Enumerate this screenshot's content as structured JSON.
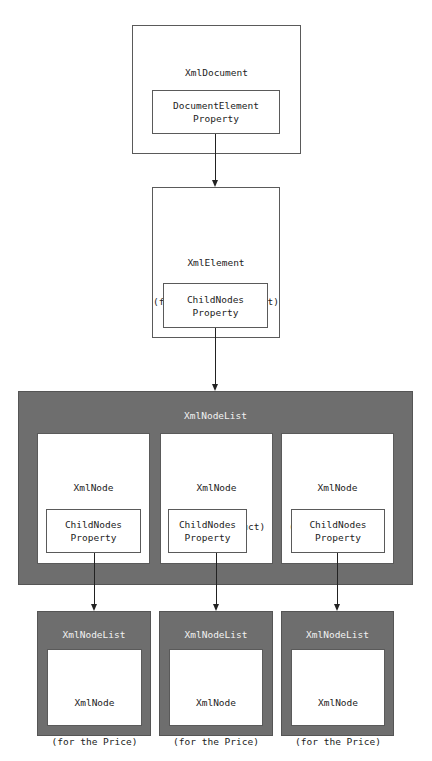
{
  "diagram": {
    "xml_document": {
      "title": "XmlDocument",
      "property_line1": "DocumentElement",
      "property_line2": "Property"
    },
    "xml_element": {
      "title_line1": "XmlElement",
      "title_line2": "(for the root element)",
      "property_line1": "ChildNodes",
      "property_line2": "Property"
    },
    "node_list": {
      "title": "XmlNodeList",
      "nodes": [
        {
          "title_line1": "XmlNode",
          "title_line2": "(for the Product)",
          "property_line1": "ChildNodes",
          "property_line2": "Property"
        },
        {
          "title_line1": "XmlNode",
          "title_line2": "(for the Product)",
          "property_line1": "ChildNodes",
          "property_line2": "Property"
        },
        {
          "title_line1": "XmlNode",
          "title_line2": "(for the Product)",
          "property_line1": "ChildNodes",
          "property_line2": "Property"
        }
      ]
    },
    "child_lists": [
      {
        "title": "XmlNodeList",
        "node_line1": "XmlNode",
        "node_line2": "(for the Price)"
      },
      {
        "title": "XmlNodeList",
        "node_line1": "XmlNode",
        "node_line2": "(for the Price)"
      },
      {
        "title": "XmlNodeList",
        "node_line1": "XmlNode",
        "node_line2": "(for the Price)"
      }
    ],
    "colors": {
      "list_fill": "#6e6e6e",
      "box_fill": "#ffffff",
      "border": "#5a5a5a",
      "connector": "#222222"
    }
  }
}
